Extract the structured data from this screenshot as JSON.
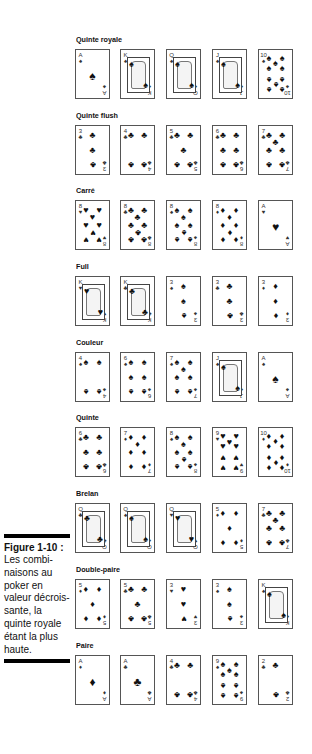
{
  "caption": {
    "title": "Figure 1-10 :",
    "body": "Les combi-naisons au poker en valeur décrois-sante, la quinte royale étant la plus haute."
  },
  "hands": [
    {
      "label": "Quinte royale",
      "cards": [
        {
          "rank": "A",
          "suit": "♠"
        },
        {
          "rank": "K",
          "suit": "♠"
        },
        {
          "rank": "Q",
          "suit": "♠"
        },
        {
          "rank": "J",
          "suit": "♠"
        },
        {
          "rank": "10",
          "suit": "♠"
        }
      ]
    },
    {
      "label": "Quinte flush",
      "cards": [
        {
          "rank": "3",
          "suit": "♣"
        },
        {
          "rank": "4",
          "suit": "♣"
        },
        {
          "rank": "5",
          "suit": "♣"
        },
        {
          "rank": "6",
          "suit": "♣"
        },
        {
          "rank": "7",
          "suit": "♣"
        }
      ]
    },
    {
      "label": "Carré",
      "cards": [
        {
          "rank": "8",
          "suit": "♥"
        },
        {
          "rank": "8",
          "suit": "♣"
        },
        {
          "rank": "8",
          "suit": "♠"
        },
        {
          "rank": "8",
          "suit": "♦"
        },
        {
          "rank": "A",
          "suit": "♥"
        }
      ]
    },
    {
      "label": "Full",
      "cards": [
        {
          "rank": "K",
          "suit": "♥"
        },
        {
          "rank": "K",
          "suit": "♣"
        },
        {
          "rank": "3",
          "suit": "♠"
        },
        {
          "rank": "3",
          "suit": "♣"
        },
        {
          "rank": "3",
          "suit": "♦"
        }
      ]
    },
    {
      "label": "Couleur",
      "cards": [
        {
          "rank": "4",
          "suit": "♠"
        },
        {
          "rank": "6",
          "suit": "♠"
        },
        {
          "rank": "7",
          "suit": "♠"
        },
        {
          "rank": "J",
          "suit": "♠"
        },
        {
          "rank": "A",
          "suit": "♠"
        }
      ]
    },
    {
      "label": "Quinte",
      "cards": [
        {
          "rank": "6",
          "suit": "♣"
        },
        {
          "rank": "7",
          "suit": "♦"
        },
        {
          "rank": "8",
          "suit": "♠"
        },
        {
          "rank": "9",
          "suit": "♥"
        },
        {
          "rank": "10",
          "suit": "♦"
        }
      ]
    },
    {
      "label": "Brelan",
      "cards": [
        {
          "rank": "Q",
          "suit": "♣"
        },
        {
          "rank": "Q",
          "suit": "♠"
        },
        {
          "rank": "Q",
          "suit": "♥"
        },
        {
          "rank": "5",
          "suit": "♦"
        },
        {
          "rank": "7",
          "suit": "♣"
        }
      ]
    },
    {
      "label": "Double-paire",
      "cards": [
        {
          "rank": "5",
          "suit": "♦"
        },
        {
          "rank": "5",
          "suit": "♣"
        },
        {
          "rank": "3",
          "suit": "♥"
        },
        {
          "rank": "3",
          "suit": "♠"
        },
        {
          "rank": "K",
          "suit": "♠"
        }
      ]
    },
    {
      "label": "Paire",
      "cards": [
        {
          "rank": "A",
          "suit": "♦"
        },
        {
          "rank": "A",
          "suit": "♣"
        },
        {
          "rank": "4",
          "suit": "♣"
        },
        {
          "rank": "9",
          "suit": "♠"
        },
        {
          "rank": "2",
          "suit": "♣"
        }
      ]
    }
  ]
}
